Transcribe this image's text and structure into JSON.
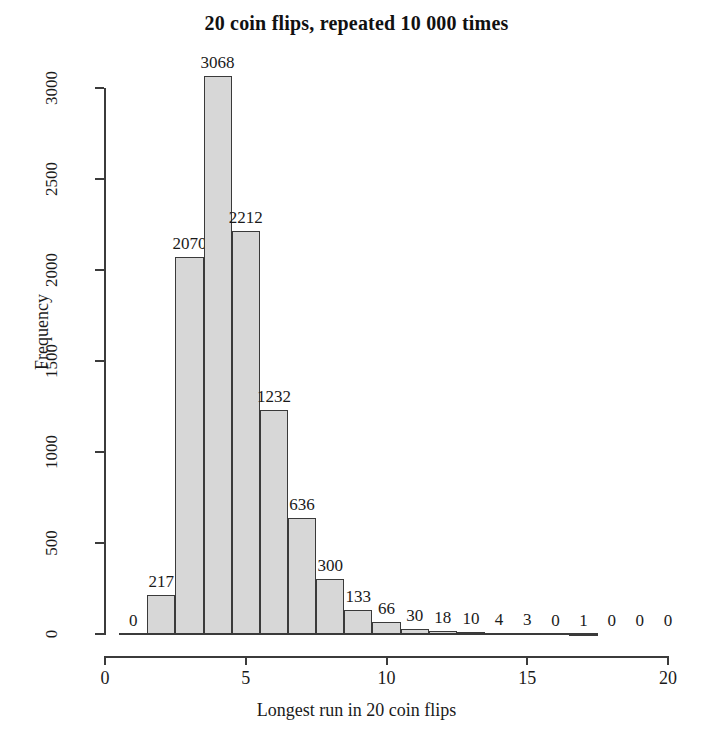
{
  "chart_data": {
    "type": "bar",
    "title": "20 coin flips, repeated 10 000 times",
    "xlabel": "Longest run in 20 coin flips",
    "ylabel": "Frequency",
    "categories": [
      1,
      2,
      3,
      4,
      5,
      6,
      7,
      8,
      9,
      10,
      11,
      12,
      13,
      14,
      15,
      16,
      17,
      18,
      19,
      20
    ],
    "values": [
      0,
      217,
      2070,
      3068,
      2212,
      1232,
      636,
      300,
      133,
      66,
      30,
      18,
      10,
      4,
      3,
      0,
      1,
      0,
      0,
      0
    ],
    "bar_labels": [
      "0",
      "217",
      "2070",
      "3068",
      "2212",
      "1232",
      "636",
      "300",
      "133",
      "66",
      "30",
      "18",
      "10",
      "4",
      "3",
      "0",
      "1",
      "0",
      "0",
      "0"
    ],
    "xlim": [
      0,
      20
    ],
    "ylim": [
      0,
      3100
    ],
    "xticks": [
      0,
      5,
      10,
      15,
      20
    ],
    "xtick_labels": [
      "0",
      "5",
      "10",
      "15",
      "20"
    ],
    "yticks": [
      0,
      500,
      1000,
      1500,
      2000,
      2500,
      3000
    ],
    "ytick_labels": [
      "0",
      "500",
      "1000",
      "1500",
      "2000",
      "2500",
      "3000"
    ],
    "grid": false,
    "legend": "none",
    "bar_fill_color": "#d7d7d7",
    "bar_edge_color": "#3a3a3a",
    "axis_color": "#3b3b3b",
    "text_color": "#1a1a1a",
    "background_color": "#ffffff",
    "total_count": 10000
  }
}
